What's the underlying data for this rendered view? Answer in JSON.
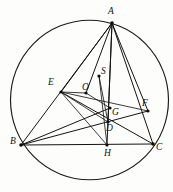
{
  "figure": {
    "width": 173,
    "height": 192,
    "background_color": "#fdfdfc",
    "stroke_color": "#141313"
  },
  "circle": {
    "name": "circumcircle",
    "center_x": 89.5,
    "center_y": 100.0,
    "radius": 79.0,
    "stroke_color": "#1c1b1a"
  },
  "points": [
    {
      "id": "A",
      "label": "A",
      "x": 112.0,
      "y": 23.0,
      "label_x": 108.0,
      "label_y": 7.0,
      "on_circle": true,
      "dot": true
    },
    {
      "id": "B",
      "label": "B",
      "x": 21.0,
      "y": 145.0,
      "label_x": 10.0,
      "label_y": 137.0,
      "on_circle": true,
      "dot": true
    },
    {
      "id": "C",
      "label": "C",
      "x": 153.0,
      "y": 144.0,
      "label_x": 156.0,
      "label_y": 143.0,
      "on_circle": true,
      "dot": true
    },
    {
      "id": "E",
      "label": "E",
      "x": 61.0,
      "y": 92.0,
      "label_x": 48.0,
      "label_y": 78.0,
      "on_circle": false,
      "dot": true
    },
    {
      "id": "F",
      "label": "F",
      "x": 148.0,
      "y": 111.0,
      "label_x": 142.0,
      "label_y": 99.0,
      "on_circle": false,
      "dot": true
    },
    {
      "id": "H",
      "label": "H",
      "x": 107.0,
      "y": 145.0,
      "label_x": 104.0,
      "label_y": 149.0,
      "on_circle": false,
      "dot": true
    },
    {
      "id": "D",
      "label": "D",
      "x": 108.0,
      "y": 122.0,
      "label_x": 106.0,
      "label_y": 124.0,
      "on_circle": false,
      "dot": true
    },
    {
      "id": "G",
      "label": "G",
      "x": 110.0,
      "y": 108.0,
      "label_x": 112.0,
      "label_y": 108.0,
      "on_circle": false,
      "dot": true
    },
    {
      "id": "O",
      "label": "O",
      "x": 86.0,
      "y": 93.0,
      "label_x": 82.0,
      "label_y": 83.0,
      "on_circle": false,
      "dot": true
    },
    {
      "id": "S",
      "label": "S",
      "x": 99.0,
      "y": 76.0,
      "label_x": 101.0,
      "label_y": 67.0,
      "on_circle": false,
      "dot": true
    }
  ],
  "segments": [
    {
      "id": "AB",
      "from": "A",
      "to": "B",
      "weight": "normal"
    },
    {
      "id": "BC",
      "from": "B",
      "to": "C",
      "weight": "normal"
    },
    {
      "id": "CA",
      "from": "C",
      "to": "A",
      "weight": "normal"
    },
    {
      "id": "AE",
      "from": "A",
      "to": "E",
      "weight": "normal"
    },
    {
      "id": "AH",
      "from": "A",
      "to": "H",
      "weight": "normal"
    },
    {
      "id": "AD",
      "from": "A",
      "to": "D",
      "weight": "normal"
    },
    {
      "id": "AF",
      "from": "A",
      "to": "F",
      "weight": "normal"
    },
    {
      "id": "AO",
      "from": "A",
      "to": "O",
      "weight": "normal"
    },
    {
      "id": "BF",
      "from": "B",
      "to": "F",
      "weight": "normal"
    },
    {
      "id": "BG",
      "from": "B",
      "to": "G",
      "weight": "normal"
    },
    {
      "id": "CE",
      "from": "C",
      "to": "E",
      "weight": "normal"
    },
    {
      "id": "EF",
      "from": "E",
      "to": "F",
      "weight": "thin"
    },
    {
      "id": "ED",
      "from": "E",
      "to": "D",
      "weight": "thin"
    },
    {
      "id": "EO",
      "from": "E",
      "to": "O",
      "weight": "thin"
    },
    {
      "id": "OG",
      "from": "O",
      "to": "G",
      "weight": "thin"
    },
    {
      "id": "SD",
      "from": "S",
      "to": "D",
      "weight": "thin"
    },
    {
      "id": "SH",
      "from": "S",
      "to": "H",
      "weight": "thin"
    },
    {
      "id": "EH",
      "from": "E",
      "to": "H",
      "weight": "thin"
    }
  ]
}
